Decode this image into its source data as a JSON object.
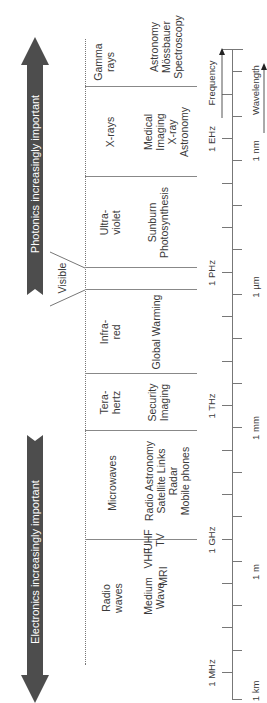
{
  "arrows": {
    "photonics": "Photonics increasingly important",
    "electronics": "Electronics increasingly important"
  },
  "bands": [
    {
      "name": "Radio waves",
      "sub": [
        {
          "name": "Medium Wave"
        },
        {
          "name": "VHF"
        },
        {
          "name": "UHF"
        },
        {
          "name": "MRI"
        },
        {
          "name": "TV"
        }
      ]
    },
    {
      "name": "Microwaves",
      "applications": [
        "Radio Astronomy",
        "Satellite Links",
        "Radar",
        "Mobile phones"
      ]
    },
    {
      "name": "Tera-hertz",
      "applications": [
        "Security",
        "Imaging"
      ]
    },
    {
      "name": "Infra-red",
      "applications": [
        "Global Warming"
      ]
    },
    {
      "name": "Visible"
    },
    {
      "name": "Ultra-violet",
      "applications": [
        "Sunburn",
        "Photosynthesis"
      ]
    },
    {
      "name": "X-rays",
      "applications": [
        "Medical",
        "Imaging",
        "X-ray",
        "Astronomy"
      ]
    },
    {
      "name": "Gamma rays",
      "applications": [
        "Astronomy",
        "Mössbauer",
        "Spectroscopy"
      ]
    }
  ],
  "labels": {
    "radio_1": "Radio",
    "radio_2": "waves",
    "micro": "Microwaves",
    "thz_1": "Tera-",
    "thz_2": "hertz",
    "ir_1": "Infra-",
    "ir_2": "red",
    "visible": "Visible",
    "uv_1": "Ultra-",
    "uv_2": "violet",
    "xray": "X-rays",
    "gamma_1": "Gamma",
    "gamma_2": "rays",
    "medium_1": "Medium",
    "medium_2": "Wave",
    "vhf": "VHF",
    "mri": "MRI",
    "uhf": "UHF",
    "tv": "TV",
    "micro_app_1": "Radio Astronomy",
    "micro_app_2": "Satellite Links",
    "micro_app_3": "Radar",
    "micro_app_4": "Mobile phones",
    "thz_app_1": "Security",
    "thz_app_2": "Imaging",
    "ir_app": "Global Warming",
    "uv_app_1": "Sunburn",
    "uv_app_2": "Photosynthesis",
    "xray_app_1": "Medical",
    "xray_app_2": "Imaging",
    "xray_app_3": "X-ray",
    "xray_app_4": "Astronomy",
    "gamma_app_1": "Astronomy",
    "gamma_app_2": "Mössbauer",
    "gamma_app_3": "Spectroscopy"
  },
  "axis": {
    "frequency_label": "Frequency",
    "wavelength_label": "Wavelength",
    "frequency_ticks": [
      "1 MHz",
      "1 GHz",
      "1 THz",
      "1 PHz",
      "1 EHz"
    ],
    "wavelength_ticks": [
      "1 km",
      "1 m",
      "1 mm",
      "1 µm",
      "1 nm"
    ]
  }
}
